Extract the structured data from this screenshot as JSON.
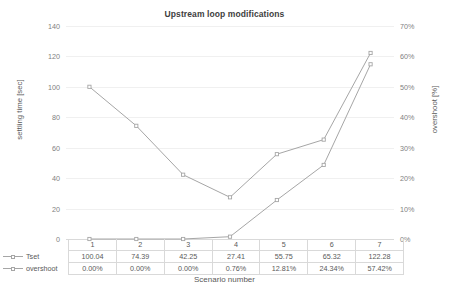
{
  "chart_data": {
    "type": "line",
    "title": "Upstream loop modifications",
    "xlabel": "Scenario number",
    "ylabel": "settling time [sec]",
    "y2label": "overshoot [%]",
    "categories": [
      "1",
      "2",
      "3",
      "4",
      "5",
      "6",
      "7"
    ],
    "grid": true,
    "legend_position": "bottom-left-table",
    "ylim": [
      0,
      140
    ],
    "y2lim": [
      0,
      70
    ],
    "yticks": [
      "0",
      "20",
      "40",
      "60",
      "80",
      "100",
      "120",
      "140"
    ],
    "y2ticks": [
      "0%",
      "10%",
      "20%",
      "30%",
      "40%",
      "50%",
      "60%",
      "70%"
    ],
    "series": [
      {
        "name": "Tset",
        "axis": "left",
        "color": "#a6a6a6",
        "values": [
          100.04,
          74.39,
          42.25,
          27.41,
          55.75,
          65.32,
          122.28
        ],
        "labels": [
          "100.04",
          "74.39",
          "42.25",
          "27.41",
          "55.75",
          "65.32",
          "122.28"
        ]
      },
      {
        "name": "overshoot",
        "axis": "right",
        "color": "#a6a6a6",
        "values": [
          0.0,
          0.0,
          0.0,
          0.76,
          12.81,
          24.34,
          57.42
        ],
        "labels": [
          "0.00%",
          "0.00%",
          "0.00%",
          "0.76%",
          "12.81%",
          "24.34%",
          "57.42%"
        ]
      }
    ]
  },
  "colors": {
    "gridline": "#f0f0f0",
    "axis": "#d9d9d9",
    "series": "#a6a6a6",
    "text": "#595959",
    "title": "#404040",
    "background": "#ffffff"
  }
}
